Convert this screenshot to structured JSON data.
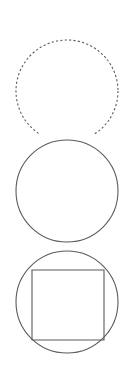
{
  "canvas": {
    "width": 134,
    "height": 376,
    "background_color": "#ffffff"
  },
  "figures": [
    {
      "name": "dashed-circle",
      "label": "Dashed circle",
      "shape": "circle",
      "stroke_color": "#5b5b5b",
      "stroke_width": 1.1,
      "stroke_style": "dashed",
      "dash_pattern": "2.2 2.2",
      "fill": "none",
      "center_x": 67,
      "center_y": 75,
      "radius": 51,
      "bounds": {
        "x": 16,
        "y": 24,
        "width": 102,
        "height": 102
      }
    },
    {
      "name": "plain-circle",
      "label": "Plain circle",
      "shape": "circle",
      "stroke_color": "#5b5b5b",
      "stroke_width": 1.1,
      "stroke_style": "solid",
      "fill": "none",
      "center_x": 67,
      "center_y": 59,
      "radius": 51,
      "bounds": {
        "x": 16,
        "y": 140,
        "width": 102,
        "height": 102
      }
    },
    {
      "name": "circle-with-inscribed-square",
      "label": "Circle with inscribed square",
      "shape": "circle+square",
      "stroke_color": "#5b5b5b",
      "stroke_width": 1.1,
      "stroke_style": "solid",
      "fill": "none",
      "circle": {
        "center_x": 67,
        "center_y": 59,
        "radius": 51,
        "bounds": {
          "x": 16,
          "y": 251,
          "width": 102,
          "height": 102
        }
      },
      "square": {
        "x": 32,
        "y": 270,
        "width": 72,
        "height": 70,
        "local_x": 32,
        "local_y": 27
      }
    }
  ]
}
